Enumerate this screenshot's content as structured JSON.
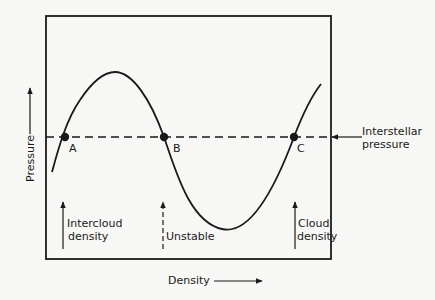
{
  "diagram": {
    "type": "phase-diagram",
    "colors": {
      "ink": "#1a1a1a",
      "background": "#f7f7f5"
    },
    "axes": {
      "x_label": "Density",
      "y_label": "Pressure"
    },
    "reference_line": {
      "label_line1": "Interstellar",
      "label_line2": "pressure",
      "style": "dashed"
    },
    "points": [
      {
        "id": "A",
        "label": "A"
      },
      {
        "id": "B",
        "label": "B"
      },
      {
        "id": "C",
        "label": "C"
      }
    ],
    "markers": [
      {
        "id": "intercloud",
        "line1": "Intercloud",
        "line2": "density",
        "style": "solid"
      },
      {
        "id": "unstable",
        "line1": "Unstable",
        "line2": "",
        "style": "dashed"
      },
      {
        "id": "cloud",
        "line1": "Cloud",
        "line2": "density",
        "style": "solid"
      }
    ]
  }
}
